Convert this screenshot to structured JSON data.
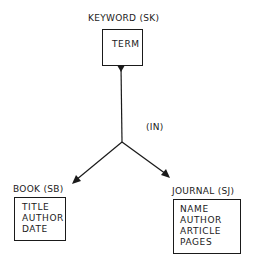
{
  "diagram": {
    "type": "entity-relationship",
    "nodes": [
      {
        "id": "keyword",
        "title": "KEYWORD (SK)",
        "fields": [
          "TERM"
        ]
      },
      {
        "id": "book",
        "title": "BOOK (SB)",
        "fields": [
          "TITLE",
          "AUTHOR",
          "DATE"
        ]
      },
      {
        "id": "journal",
        "title": "JOURNAL (SJ)",
        "fields": [
          "NAME",
          "AUTHOR",
          "ARTICLE",
          "PAGES"
        ]
      }
    ],
    "relationship": {
      "label": "(IN)",
      "from": "keyword",
      "to": [
        "book",
        "journal"
      ]
    }
  }
}
